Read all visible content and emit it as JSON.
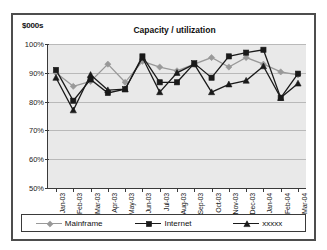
{
  "chart_data": {
    "type": "line",
    "title": "Capacity / utilization",
    "ylabel": "$000s",
    "xlabel": "",
    "ylim": [
      50,
      100
    ],
    "ytick_labels": [
      "100%",
      "90%",
      "80%",
      "70%",
      "60%",
      "50%"
    ],
    "ytick_values": [
      100,
      90,
      80,
      70,
      60,
      50
    ],
    "grid": true,
    "legend_position": "bottom",
    "categories": [
      "Jan-03",
      "Feb-03",
      "Mar-03",
      "Apr-03",
      "May-03",
      "Jun-03",
      "Jul-03",
      "Aug-03",
      "Sep-03",
      "Oct-03",
      "Nov-03",
      "Dec-03",
      "Jan-04",
      "Feb-04",
      "Mar-04"
    ],
    "series": [
      {
        "name": "Mainframe",
        "color": "#999999",
        "marker": "diamond",
        "values": [
          90.0,
          85.3,
          87.0,
          93.0,
          86.7,
          94.0,
          92.0,
          90.7,
          93.0,
          95.3,
          92.0,
          95.3,
          93.0,
          90.3,
          89.3
        ]
      },
      {
        "name": "Internet",
        "color": "#1a1a1a",
        "marker": "square",
        "values": [
          91.0,
          80.3,
          87.7,
          83.0,
          84.3,
          95.7,
          86.7,
          86.7,
          93.3,
          88.3,
          95.7,
          97.0,
          98.0,
          81.3,
          89.7
        ]
      },
      {
        "name": "xxxxx",
        "color": "#1a1a1a",
        "marker": "triangle",
        "values": [
          88.3,
          77.0,
          89.3,
          84.0,
          84.3,
          95.3,
          83.3,
          90.0,
          93.0,
          83.3,
          86.0,
          87.3,
          92.3,
          81.3,
          86.3
        ]
      }
    ]
  },
  "legend": {
    "items": [
      {
        "label": "Mainframe"
      },
      {
        "label": "Internet"
      },
      {
        "label": "xxxxx"
      }
    ]
  }
}
